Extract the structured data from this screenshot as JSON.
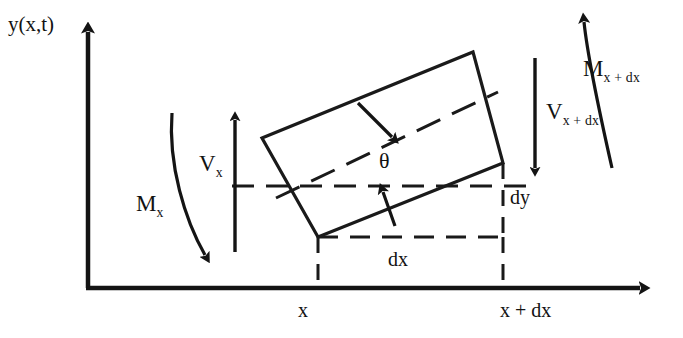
{
  "figure": {
    "axes": {
      "y_axis_label": "y(x,t)",
      "x_axis_label": "",
      "origin_label": ""
    },
    "labels": {
      "shear_left_base": "V",
      "shear_left_sub": "x",
      "shear_right_base": "V",
      "shear_right_sub": "x + dx",
      "moment_left_base": "M",
      "moment_left_sub": "x",
      "moment_right_base": "M",
      "moment_right_sub": "x + dx",
      "angle": "θ",
      "dx": "dx",
      "dy": "dy",
      "x_tick": "x",
      "x_plus_dx_tick": "x + dx"
    },
    "colors": {
      "ink": "#121212",
      "background": "#ffffff",
      "stroke": "#1a1a1a"
    },
    "geometry": {
      "origin": [
        88,
        288
      ],
      "y_axis_top": [
        88,
        26
      ],
      "x_axis_right": [
        660,
        288
      ],
      "element_corners": {
        "top_left": [
          262,
          138
        ],
        "top_right": [
          473,
          52
        ],
        "bottom_right": [
          503,
          163
        ],
        "bottom_left": [
          318,
          237
        ]
      },
      "neutral_axis_dashed": [
        [
          232,
          186
        ],
        [
          532,
          186
        ]
      ],
      "element_centerline_dashed": [
        [
          278,
          197
        ],
        [
          496,
          94
        ]
      ],
      "shear_left_arrow": [
        [
          235,
          250
        ],
        [
          235,
          113
        ]
      ],
      "shear_right_arrow": [
        [
          535,
          57
        ],
        [
          535,
          175
        ]
      ],
      "x_tick_position": 318,
      "x_plus_dx_tick_position": 503
    }
  }
}
